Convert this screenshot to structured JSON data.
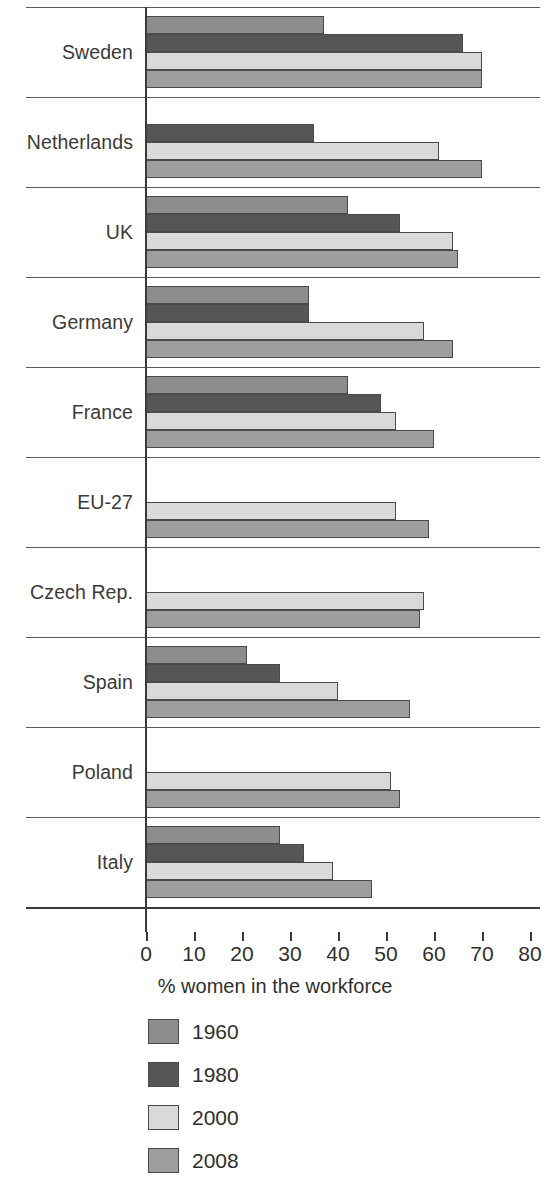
{
  "chart_data": {
    "type": "bar",
    "orientation": "horizontal",
    "title": "",
    "xlabel": "% women in the workforce",
    "ylabel": "",
    "xlim": [
      0,
      80
    ],
    "xticks": [
      0,
      10,
      20,
      30,
      40,
      50,
      60,
      70,
      80
    ],
    "xtick_labels": [
      "0",
      "10",
      "20",
      "30",
      "40",
      "50",
      "60",
      "70",
      "80"
    ],
    "grid": false,
    "legend_position": "bottom",
    "categories": [
      "Sweden",
      "Netherlands",
      "UK",
      "Germany",
      "France",
      "EU-27",
      "Czech Rep.",
      "Spain",
      "Poland",
      "Italy"
    ],
    "series": [
      {
        "name": "1960",
        "color": "#8d8d8d",
        "values": [
          37,
          null,
          42,
          34,
          42,
          null,
          null,
          21,
          null,
          28
        ]
      },
      {
        "name": "1980",
        "color": "#565656",
        "values": [
          66,
          35,
          53,
          34,
          49,
          null,
          null,
          28,
          null,
          33
        ]
      },
      {
        "name": "2000",
        "color": "#d9d9d9",
        "values": [
          70,
          61,
          64,
          58,
          52,
          52,
          58,
          40,
          51,
          39
        ]
      },
      {
        "name": "2008",
        "color": "#9e9e9e",
        "values": [
          70,
          70,
          65,
          64,
          60,
          59,
          57,
          55,
          53,
          47
        ]
      }
    ]
  },
  "legend": {
    "entries": [
      {
        "label": "1960",
        "color": "#8d8d8d"
      },
      {
        "label": "1980",
        "color": "#565656"
      },
      {
        "label": "2000",
        "color": "#d9d9d9"
      },
      {
        "label": "2008",
        "color": "#9e9e9e"
      }
    ]
  }
}
